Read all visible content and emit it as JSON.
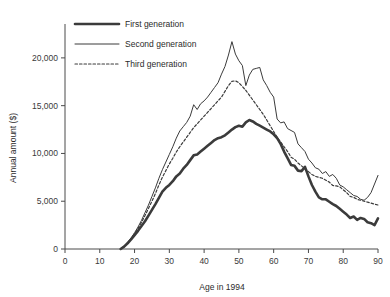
{
  "chart_data": {
    "type": "line",
    "title": "",
    "xlabel": "Age in 1994",
    "ylabel": "Annual amount ($)",
    "xlim": [
      0,
      90
    ],
    "ylim": [
      0,
      22500
    ],
    "grid": false,
    "legend_position": "top-left",
    "xticks": [
      0,
      10,
      20,
      30,
      40,
      50,
      60,
      70,
      80,
      90
    ],
    "xtick_labels": [
      "0",
      "10",
      "20",
      "30",
      "40",
      "50",
      "60",
      "70",
      "80",
      "90"
    ],
    "yticks": [
      0,
      5000,
      10000,
      15000,
      20000
    ],
    "ytick_labels": [
      "0",
      "5,000",
      "10,000",
      "15,000",
      "20,000"
    ],
    "series": [
      {
        "name": "First generation",
        "style": "thick-solid",
        "color": "#3b3b3b",
        "width": 2.6,
        "x": [
          16,
          17,
          18,
          19,
          20,
          21,
          22,
          23,
          24,
          25,
          26,
          27,
          28,
          29,
          30,
          31,
          32,
          33,
          34,
          35,
          36,
          37,
          38,
          39,
          40,
          41,
          42,
          43,
          44,
          45,
          46,
          47,
          48,
          49,
          50,
          51,
          52,
          53,
          54,
          55,
          56,
          57,
          58,
          59,
          60,
          61,
          62,
          63,
          64,
          65,
          66,
          67,
          68,
          69,
          70,
          71,
          72,
          73,
          74,
          75,
          76,
          77,
          78,
          79,
          80,
          81,
          82,
          83,
          84,
          85,
          86,
          87,
          88,
          89,
          90
        ],
        "y": [
          0,
          250,
          600,
          1000,
          1450,
          1900,
          2400,
          2900,
          3500,
          4100,
          4700,
          5350,
          6000,
          6400,
          6700,
          7100,
          7600,
          7900,
          8400,
          8800,
          9300,
          9800,
          9900,
          10200,
          10500,
          10800,
          11100,
          11400,
          11600,
          11700,
          11900,
          12200,
          12500,
          12750,
          12900,
          12800,
          13250,
          13500,
          13350,
          13100,
          12900,
          12700,
          12500,
          12300,
          12000,
          11600,
          11000,
          10200,
          9500,
          8800,
          8700,
          8200,
          8150,
          8600,
          7600,
          6700,
          6000,
          5400,
          5200,
          5200,
          4950,
          4700,
          4500,
          4200,
          3900,
          3600,
          3250,
          3400,
          3050,
          3250,
          3150,
          2800,
          2700,
          2500,
          3200
        ]
      },
      {
        "name": "Second generation",
        "style": "thin-solid",
        "color": "#3b3b3b",
        "width": 1.0,
        "x": [
          16,
          17,
          18,
          19,
          20,
          21,
          22,
          23,
          24,
          25,
          26,
          27,
          28,
          29,
          30,
          31,
          32,
          33,
          34,
          35,
          36,
          37,
          38,
          39,
          40,
          41,
          42,
          43,
          44,
          45,
          46,
          47,
          48,
          49,
          50,
          51,
          52,
          53,
          54,
          55,
          56,
          57,
          58,
          59,
          60,
          61,
          62,
          63,
          64,
          65,
          66,
          67,
          68,
          69,
          70,
          71,
          72,
          73,
          74,
          75,
          76,
          77,
          78,
          79,
          80,
          81,
          82,
          83,
          84,
          85,
          86,
          87,
          88,
          89,
          90
        ],
        "y": [
          0,
          300,
          700,
          1150,
          1700,
          2300,
          3000,
          3800,
          4600,
          5500,
          6400,
          7400,
          8300,
          9100,
          9900,
          10700,
          11600,
          12350,
          12800,
          13250,
          13900,
          15100,
          14600,
          15200,
          15500,
          15900,
          16400,
          16900,
          17400,
          18300,
          19100,
          20300,
          21700,
          20400,
          19700,
          19200,
          17100,
          18200,
          18800,
          18900,
          19000,
          17700,
          17100,
          16400,
          15900,
          13600,
          13200,
          13300,
          12600,
          12400,
          12200,
          11000,
          10600,
          10200,
          9400,
          9000,
          8500,
          8350,
          7900,
          8100,
          7600,
          7800,
          7400,
          6700,
          6500,
          6200,
          5900,
          5600,
          5500,
          5200,
          5100,
          5400,
          5900,
          6800,
          7700
        ]
      },
      {
        "name": "Third generation",
        "style": "dotted",
        "color": "#3b3b3b",
        "width": 1.2,
        "x": [
          16,
          17,
          18,
          19,
          20,
          21,
          22,
          23,
          24,
          25,
          26,
          27,
          28,
          29,
          30,
          31,
          32,
          33,
          34,
          35,
          36,
          37,
          38,
          39,
          40,
          41,
          42,
          43,
          44,
          45,
          46,
          47,
          48,
          49,
          50,
          51,
          52,
          53,
          54,
          55,
          56,
          57,
          58,
          59,
          60,
          61,
          62,
          63,
          64,
          65,
          66,
          67,
          68,
          69,
          70,
          71,
          72,
          73,
          74,
          75,
          76,
          77,
          78,
          79,
          80,
          81,
          82,
          83,
          84,
          85,
          86,
          87,
          88,
          89,
          90
        ],
        "y": [
          0,
          280,
          650,
          1080,
          1600,
          2150,
          2800,
          3500,
          4250,
          5000,
          5800,
          6700,
          7500,
          8200,
          8900,
          9500,
          10150,
          10700,
          11200,
          11700,
          12200,
          12700,
          13100,
          13500,
          13900,
          14300,
          14700,
          15100,
          15500,
          15900,
          16500,
          17100,
          17550,
          17600,
          17400,
          17000,
          16600,
          16100,
          15600,
          15100,
          14600,
          14100,
          13500,
          12900,
          12300,
          11700,
          11200,
          10700,
          10200,
          9600,
          9400,
          9000,
          8700,
          8400,
          8100,
          7800,
          7600,
          7500,
          7400,
          7200,
          7000,
          6650,
          6600,
          6500,
          6200,
          5900,
          5500,
          5400,
          5200,
          5100,
          5000,
          4900,
          4800,
          4700,
          4600
        ]
      }
    ]
  },
  "legend": {
    "entries": [
      {
        "label": "First generation"
      },
      {
        "label": "Second generation"
      },
      {
        "label": "Third generation"
      }
    ]
  }
}
